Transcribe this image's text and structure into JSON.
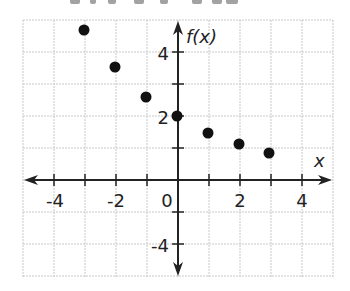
{
  "chart_data": {
    "type": "scatter",
    "title": "",
    "xlabel": "x",
    "ylabel": "f(x)",
    "x": [
      -3,
      -2,
      -1,
      0,
      1,
      2,
      3
    ],
    "y": [
      4.74,
      3.56,
      2.67,
      2,
      1.5,
      1.13,
      0.84
    ],
    "series": [
      {
        "name": "f(x)",
        "x": [
          -3,
          -2,
          -1,
          0,
          1,
          2,
          3
        ],
        "values": [
          4.74,
          3.56,
          2.67,
          2,
          1.5,
          1.13,
          0.84
        ]
      }
    ],
    "xlim": [
      -5,
      5
    ],
    "ylim": [
      -3,
      5
    ],
    "x_tick_labels": [
      "-4",
      "-2",
      "0",
      "2",
      "4"
    ],
    "y_tick_labels": [
      "4",
      "2",
      "-4"
    ],
    "grid": true,
    "legend": null
  },
  "render": {
    "colors": {
      "grid": "#c8c8c8",
      "axis": "#222222",
      "point": "#111111",
      "text": "#222222"
    },
    "origin_px": [
      178,
      180
    ],
    "unit_px_x": 31,
    "unit_px_y": 32,
    "grid_left": 23,
    "grid_right": 333,
    "grid_top": 20,
    "grid_bottom": 277,
    "point_px": [
      [
        84,
        30
      ],
      [
        115,
        67
      ],
      [
        146,
        97
      ],
      [
        177,
        116
      ],
      [
        208,
        133
      ],
      [
        239,
        144
      ],
      [
        269,
        153
      ]
    ],
    "x_label_px": [
      [
        55,
        "-4"
      ],
      [
        116,
        "-2"
      ],
      [
        167,
        "0"
      ],
      [
        240,
        "2"
      ],
      [
        302,
        "4"
      ]
    ],
    "y_label_px": [
      [
        53,
        "4"
      ],
      [
        117,
        "2"
      ],
      [
        245,
        "-4"
      ]
    ]
  }
}
